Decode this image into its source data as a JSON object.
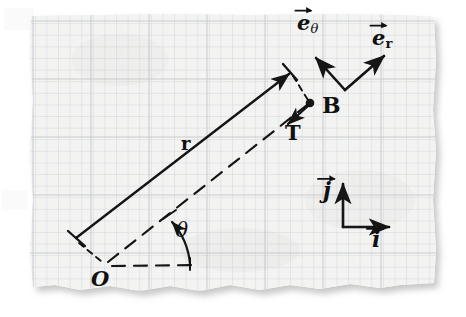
{
  "figure": {
    "kind": "hand-drawn physics diagram on torn graph paper",
    "title_text": "",
    "background_color": "#ffffff",
    "paper_color": "#f2f2f2",
    "grid_color": "#c9ccd1",
    "ink_color": "#101010"
  },
  "labels": {
    "origin": "O",
    "radius": "r",
    "angle": "θ",
    "point_b": "B",
    "tension": "T",
    "e_theta_base": "e",
    "e_theta_sub": "θ",
    "e_r_base": "e",
    "e_r_sub": "r",
    "j_hat": "j",
    "i_hat": "i"
  },
  "elements": [
    {
      "name": "position-vector-r",
      "type": "solid-arrow",
      "label": "r",
      "from": "origin-offset",
      "to": "pendulum-bob-side"
    },
    {
      "name": "radial-dashed-line",
      "type": "dashed-line",
      "from": "O",
      "to": "B"
    },
    {
      "name": "horizontal-dashed-reference",
      "type": "dashed-line",
      "from": "O",
      "to": "right"
    },
    {
      "name": "angle-arc-theta",
      "type": "curved-arrow",
      "label": "θ"
    },
    {
      "name": "tension-vector-T",
      "type": "solid-arrow",
      "label": "T",
      "points": "from B toward O"
    },
    {
      "name": "unit-vector-e-theta",
      "type": "solid-arrow",
      "label": "eθ"
    },
    {
      "name": "unit-vector-e-r",
      "type": "solid-arrow",
      "label": "er"
    },
    {
      "name": "unit-vector-j",
      "type": "solid-arrow",
      "label": "j",
      "direction": "up"
    },
    {
      "name": "unit-vector-i",
      "type": "solid-arrow",
      "label": "i",
      "direction": "right"
    },
    {
      "name": "point-marker-B",
      "type": "filled-dot"
    }
  ],
  "geometry": {
    "origin_point": [
      103,
      266
    ],
    "bob_point": [
      310,
      103
    ],
    "r_arrow_tail": [
      76,
      238
    ],
    "r_arrow_tip": [
      291,
      72
    ],
    "polar_basis_vertex": [
      345,
      90
    ],
    "e_theta_tip": [
      313,
      56
    ],
    "e_r_tip": [
      387,
      53
    ],
    "cart_basis_corner": [
      343,
      227
    ],
    "j_tip": [
      343,
      181
    ],
    "i_tip": [
      392,
      227
    ],
    "tension_tip": [
      286,
      125
    ]
  }
}
